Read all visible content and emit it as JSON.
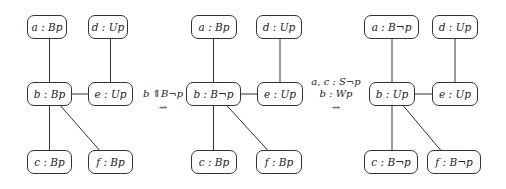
{
  "diagram": {
    "models": [
      {
        "id": "left",
        "nodes": [
          {
            "id": "a",
            "label": "a : Bp",
            "x": 27,
            "y": 15,
            "w": 40
          },
          {
            "id": "d",
            "label": "d : Up",
            "x": 88,
            "y": 15,
            "w": 40
          },
          {
            "id": "b",
            "label": "b : Bp",
            "x": 27,
            "y": 82,
            "w": 45
          },
          {
            "id": "e",
            "label": "e : Up",
            "x": 88,
            "y": 82,
            "w": 45
          },
          {
            "id": "c",
            "label": "c : Bp",
            "x": 27,
            "y": 150,
            "w": 45
          },
          {
            "id": "f",
            "label": "f : Bp",
            "x": 88,
            "y": 150,
            "w": 45
          }
        ]
      },
      {
        "id": "middle",
        "nodes": [
          {
            "id": "a",
            "label": "a : Bp",
            "x": 191,
            "y": 15,
            "w": 46
          },
          {
            "id": "d",
            "label": "d : Up",
            "x": 256,
            "y": 15,
            "w": 46
          },
          {
            "id": "b",
            "label": "b : B¬p",
            "x": 186,
            "y": 82,
            "w": 55
          },
          {
            "id": "e",
            "label": "e : Up",
            "x": 257,
            "y": 82,
            "w": 46
          },
          {
            "id": "c",
            "label": "c : Bp",
            "x": 191,
            "y": 150,
            "w": 46
          },
          {
            "id": "f",
            "label": "f : Bp",
            "x": 256,
            "y": 150,
            "w": 46
          }
        ]
      },
      {
        "id": "right",
        "nodes": [
          {
            "id": "a",
            "label": "a : B¬p",
            "x": 364,
            "y": 15,
            "w": 55
          },
          {
            "id": "d",
            "label": "d : Up",
            "x": 432,
            "y": 15,
            "w": 46
          },
          {
            "id": "b",
            "label": "b : Up",
            "x": 369,
            "y": 82,
            "w": 46
          },
          {
            "id": "e",
            "label": "e : Up",
            "x": 432,
            "y": 82,
            "w": 46
          },
          {
            "id": "c",
            "label": "c : B¬p",
            "x": 364,
            "y": 150,
            "w": 54
          },
          {
            "id": "f",
            "label": "f : B¬p",
            "x": 427,
            "y": 150,
            "w": 54
          }
        ]
      }
    ],
    "edges": [
      [
        "a",
        "b"
      ],
      [
        "d",
        "e"
      ],
      [
        "b",
        "e"
      ],
      [
        "b",
        "c"
      ],
      [
        "b",
        "f"
      ]
    ],
    "transitions": [
      {
        "line1": "b ⇑B¬p",
        "line2": "",
        "arrow": "⇝",
        "x": 142,
        "y": 88
      },
      {
        "line1": "a, c : S¬p",
        "line2": "b : Wp",
        "arrow": "⇝",
        "x": 310,
        "y": 76
      }
    ]
  },
  "colors": {
    "stroke": "#333333",
    "background": "#ffffff"
  }
}
